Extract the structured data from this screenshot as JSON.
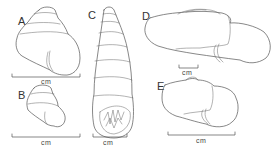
{
  "figure": {
    "type": "scientific-illustration",
    "background": "#ffffff",
    "line_color": "#555555",
    "panels": [
      {
        "id": "A",
        "label": "A",
        "view": "apertural view, conical shell",
        "scale_label": "cm"
      },
      {
        "id": "B",
        "label": "B",
        "view": "apertural view, smaller conical shell",
        "scale_label": "cm"
      },
      {
        "id": "C",
        "label": "C",
        "view": "elongate shell with toothed aperture",
        "scale_label": "cm"
      },
      {
        "id": "D",
        "label": "D",
        "view": "flattened elongate shell, side view",
        "scale_label": "cm"
      },
      {
        "id": "E",
        "label": "E",
        "view": "flattened shell, side view",
        "scale_label": "cm"
      }
    ]
  }
}
